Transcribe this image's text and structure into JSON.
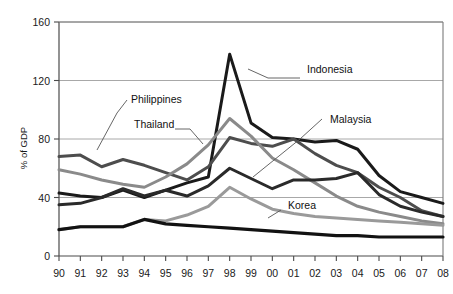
{
  "chart_data": {
    "type": "line",
    "title": "",
    "xlabel": "",
    "ylabel": "% of GDP",
    "x": [
      "90",
      "91",
      "92",
      "93",
      "94",
      "95",
      "96",
      "97",
      "98",
      "99",
      "00",
      "01",
      "02",
      "03",
      "04",
      "05",
      "06",
      "07",
      "08"
    ],
    "xlim": [
      "90",
      "08"
    ],
    "ylim": [
      0,
      160
    ],
    "yticks": [
      0,
      40,
      80,
      120,
      160
    ],
    "ytick_labels": [
      "0",
      "40",
      "80",
      "120",
      "160"
    ],
    "grid": "horizontal",
    "legend_position": "inline-annotations",
    "series": [
      {
        "name": "Indonesia",
        "color": "#1a1a1a",
        "width": 3.0,
        "values": [
          43,
          41,
          40,
          45,
          40,
          45,
          50,
          54,
          138,
          91,
          81,
          80,
          78,
          79,
          73,
          55,
          44,
          40,
          36
        ],
        "label_x": 307,
        "label_y": 73,
        "leader": [
          [
            248,
            69
          ],
          [
            268,
            78
          ],
          [
            300,
            78
          ]
        ]
      },
      {
        "name": "Philippines",
        "color": "#4d4d4d",
        "width": 3.0,
        "values": [
          68,
          69,
          61,
          66,
          62,
          57,
          52,
          61,
          81,
          77,
          75,
          80,
          70,
          62,
          57,
          47,
          40,
          31,
          27
        ],
        "label_x": 131,
        "label_y": 103,
        "leader": [
          [
            97,
            150
          ],
          [
            117,
            113
          ],
          [
            127,
            100
          ]
        ]
      },
      {
        "name": "Thailand",
        "color": "#8a8a8a",
        "width": 3.0,
        "values": [
          59,
          56,
          52,
          49,
          47,
          54,
          63,
          76,
          94,
          82,
          67,
          59,
          50,
          41,
          34,
          30,
          27,
          24,
          22
        ],
        "label_x": 134,
        "label_y": 128,
        "leader": [
          [
            175,
            129
          ],
          [
            190,
            129
          ],
          [
            203,
            144
          ]
        ]
      },
      {
        "name": "Malaysia",
        "color": "#2a2a2a",
        "width": 3.0,
        "values": [
          35,
          36,
          40,
          46,
          41,
          45,
          41,
          48,
          60,
          53,
          46,
          52,
          52,
          53,
          57,
          42,
          34,
          30,
          27
        ],
        "label_x": 330,
        "label_y": 123,
        "leader": [
          [
            253,
            177
          ],
          [
            300,
            139
          ],
          [
            322,
            119
          ]
        ]
      },
      {
        "name": "Korea",
        "color": "#9a9a9a",
        "width": 3.0,
        "values": [
          18,
          20,
          20,
          20,
          25,
          24,
          28,
          34,
          47,
          39,
          32,
          29,
          27,
          26,
          25,
          24,
          23,
          22,
          21
        ],
        "label_x": 288,
        "label_y": 209,
        "leader": [
          [
            268,
            218
          ],
          [
            281,
            210
          ]
        ]
      },
      {
        "name": "Baseline",
        "color": "#121212",
        "width": 3.2,
        "values": [
          18,
          20,
          20,
          20,
          25,
          22,
          21,
          20,
          19,
          18,
          17,
          16,
          15,
          14,
          14,
          13,
          13,
          13,
          13
        ],
        "label_x": null,
        "label_y": null,
        "leader": null
      }
    ]
  },
  "axis": {
    "y_title": "% of GDP",
    "y_tick_0": "0",
    "y_tick_40": "40",
    "y_tick_80": "80",
    "y_tick_120": "120",
    "y_tick_160": "160"
  },
  "labels": {
    "indonesia": "Indonesia",
    "philippines": "Philippines",
    "thailand": "Thailand",
    "malaysia": "Malaysia",
    "korea": "Korea"
  }
}
